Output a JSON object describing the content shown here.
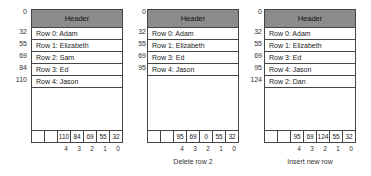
{
  "panels": [
    {
      "header": "Header",
      "header_offset": "0",
      "rows": [
        {
          "offset": "32",
          "label": "Row 0: Adam"
        },
        {
          "offset": "55",
          "label": "Row 1: Elizabeth"
        },
        {
          "offset": "69",
          "label": "Row 2: Sam"
        },
        {
          "offset": "84",
          "label": "Row 3: Ed"
        },
        {
          "offset": "110",
          "label": "Row 4: Jason"
        }
      ],
      "slots": [
        "",
        "",
        "110",
        "84",
        "69",
        "55",
        "32"
      ],
      "slot_indices": [
        "4",
        "3",
        "2",
        "1",
        "0"
      ],
      "caption": ""
    },
    {
      "header": "Header",
      "header_offset": "0",
      "rows": [
        {
          "offset": "32",
          "label": "Row 0: Adam"
        },
        {
          "offset": "55",
          "label": "Row 1: Elizabeth"
        },
        {
          "offset": "69",
          "label": "Row 3: Ed"
        },
        {
          "offset": "95",
          "label": "Row 4: Jason"
        }
      ],
      "slots": [
        "",
        "",
        "95",
        "69",
        "0",
        "55",
        "32"
      ],
      "slot_indices": [
        "4",
        "3",
        "2",
        "1",
        "0"
      ],
      "caption": "Delete row 2"
    },
    {
      "header": "Header",
      "header_offset": "0",
      "rows": [
        {
          "offset": "32",
          "label": "Row 0: Adam"
        },
        {
          "offset": "55",
          "label": "Row 1: Elizabeth"
        },
        {
          "offset": "69",
          "label": "Row 3: Ed"
        },
        {
          "offset": "95",
          "label": "Row 4: Jason"
        },
        {
          "offset": "124",
          "label": "Row 2: Dan"
        }
      ],
      "slots": [
        "",
        "",
        "95",
        "69",
        "124",
        "55",
        "32"
      ],
      "slot_indices": [
        "4",
        "3",
        "2",
        "1",
        "0"
      ],
      "caption": "Insert new row"
    }
  ],
  "colors": {
    "header_fill": "#8c8c8c",
    "border": "#444444",
    "background": "#ffffff"
  }
}
